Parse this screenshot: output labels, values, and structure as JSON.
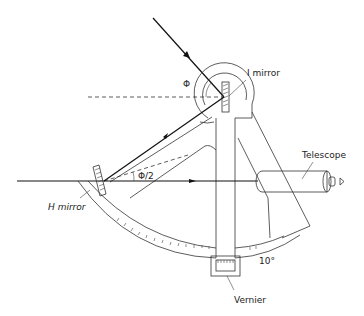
{
  "figure": {
    "type": "sextant-diagram",
    "labels": {
      "i_mirror": "I mirror",
      "h_mirror": "H mirror",
      "telescope": "Telescope",
      "vernier": "Vernier",
      "phi": "Φ",
      "phi_half": "Φ/2",
      "scale_mark": "10°"
    },
    "colors": {
      "line": "#333333",
      "background": "#ffffff"
    }
  }
}
